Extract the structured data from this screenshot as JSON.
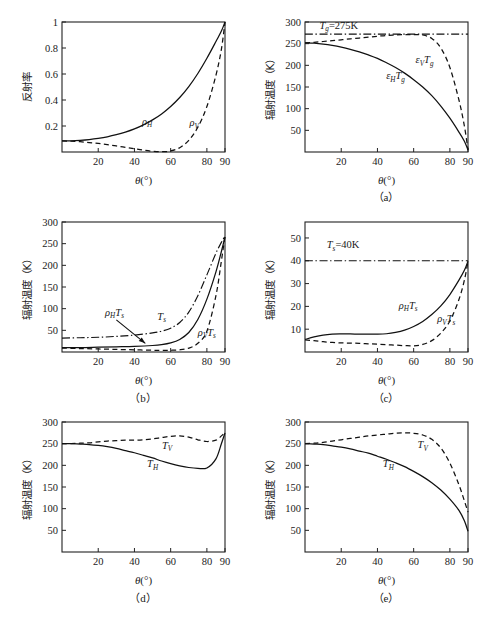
{
  "figure": {
    "width": 490,
    "height": 628,
    "background": "#ffffff",
    "line_color": "#111111"
  },
  "axis_titles": {
    "x_theta": "θ(°)",
    "y_reflectivity": "反射率",
    "y_brightness_temp": "辐射温度（K）"
  },
  "captions": {
    "a": "（a）",
    "b": "（b）",
    "c": "（c）",
    "d": "（d）",
    "e": "（e）"
  },
  "chart_data": [
    {
      "id": "panel0",
      "type": "line",
      "title": "",
      "xlabel": "θ(°)",
      "ylabel": "反射率",
      "xlim": [
        0,
        90
      ],
      "ylim": [
        0,
        1.0
      ],
      "xticks": [
        20,
        40,
        60,
        80,
        90
      ],
      "yticks": [
        0.2,
        0.4,
        0.6,
        0.8,
        1.0
      ],
      "grid": false,
      "legend": "inline-labels",
      "series": [
        {
          "name": "ρ_H",
          "label": "ρ",
          "label_sub": "H",
          "style": "solid",
          "label_pos": {
            "x": 47,
            "y": 0.21
          },
          "x": [
            0,
            5,
            10,
            15,
            20,
            25,
            30,
            35,
            40,
            45,
            50,
            55,
            60,
            65,
            70,
            75,
            80,
            85,
            88,
            90
          ],
          "y": [
            0.085,
            0.086,
            0.09,
            0.096,
            0.105,
            0.117,
            0.133,
            0.153,
            0.178,
            0.209,
            0.247,
            0.293,
            0.35,
            0.419,
            0.503,
            0.604,
            0.721,
            0.85,
            0.93,
            1.0
          ]
        },
        {
          "name": "ρ_V",
          "label": "ρ",
          "label_sub": "V",
          "style": "dashed",
          "label_pos": {
            "x": 73,
            "y": 0.2
          },
          "x": [
            0,
            5,
            10,
            15,
            20,
            25,
            30,
            35,
            40,
            45,
            50,
            55,
            60,
            65,
            70,
            75,
            80,
            85,
            88,
            90
          ],
          "y": [
            0.085,
            0.083,
            0.079,
            0.073,
            0.066,
            0.057,
            0.047,
            0.036,
            0.025,
            0.014,
            0.006,
            0.002,
            0.008,
            0.033,
            0.09,
            0.19,
            0.35,
            0.59,
            0.79,
            1.0
          ]
        }
      ]
    },
    {
      "id": "panel_a",
      "type": "line",
      "title": "",
      "xlabel": "θ(°)",
      "ylabel": "辐射温度（K）",
      "xlim": [
        0,
        90
      ],
      "ylim": [
        0,
        300
      ],
      "xticks": [
        20,
        40,
        60,
        80,
        90
      ],
      "yticks": [
        50,
        100,
        150,
        200,
        250,
        300
      ],
      "grid": false,
      "annotation": {
        "text": "T_g=275K",
        "base": "T",
        "sub": "g",
        "rest": "=275K",
        "x": 8,
        "y": 285
      },
      "series": [
        {
          "name": "T_g",
          "style": "dashdot",
          "constant": 272,
          "x": [
            0,
            90
          ],
          "y": [
            272,
            272
          ]
        },
        {
          "name": "ε_V T_g",
          "label_main": "ε",
          "label_sub1": "V",
          "label_main2": "T",
          "label_sub2": "g",
          "style": "dashed",
          "label_pos": {
            "x": 66,
            "y": 205
          },
          "x": [
            0,
            5,
            10,
            15,
            20,
            25,
            30,
            35,
            40,
            45,
            50,
            55,
            60,
            65,
            70,
            75,
            80,
            85,
            88,
            90
          ],
          "y": [
            252,
            253,
            255,
            257,
            259,
            261,
            263,
            265,
            267,
            269,
            270,
            271,
            271,
            270,
            262,
            240,
            195,
            120,
            60,
            5
          ]
        },
        {
          "name": "ε_H T_g",
          "label_main": "ε",
          "label_sub1": "H",
          "label_main2": "T",
          "label_sub2": "g",
          "style": "solid",
          "label_pos": {
            "x": 50,
            "y": 168
          },
          "x": [
            0,
            5,
            10,
            15,
            20,
            25,
            30,
            35,
            40,
            45,
            50,
            55,
            60,
            65,
            70,
            75,
            80,
            85,
            88,
            90
          ],
          "y": [
            252,
            251,
            249,
            246,
            242,
            237,
            231,
            224,
            216,
            206,
            195,
            182,
            167,
            150,
            130,
            106,
            78,
            46,
            25,
            5
          ]
        }
      ]
    },
    {
      "id": "panel_b",
      "type": "line",
      "title": "",
      "xlabel": "θ(°)",
      "ylabel": "辐射温度（K）",
      "xlim": [
        0,
        90
      ],
      "ylim": [
        0,
        300
      ],
      "xticks": [
        20,
        40,
        60,
        80,
        90
      ],
      "yticks": [
        50,
        100,
        150,
        200,
        250,
        300
      ],
      "grid": false,
      "arrow": {
        "from": {
          "x": 30,
          "y": 74
        },
        "to": {
          "x": 46,
          "y": 20
        }
      },
      "series": [
        {
          "name": "T_s",
          "label_main": "T",
          "label_sub": "s",
          "style": "dashdot",
          "label_pos": {
            "x": 55,
            "y": 75
          },
          "x": [
            0,
            10,
            20,
            30,
            40,
            50,
            55,
            60,
            65,
            70,
            75,
            80,
            85,
            88,
            90
          ],
          "y": [
            32,
            33,
            34,
            36,
            39,
            44,
            48,
            55,
            68,
            92,
            130,
            178,
            228,
            253,
            268
          ]
        },
        {
          "name": "ρ_H T_s",
          "label_main": "ρ",
          "label_sub1": "H",
          "label_main2": "T",
          "label_sub2": "s",
          "style": "solid",
          "label_pos": {
            "x": 29,
            "y": 84
          },
          "x": [
            0,
            10,
            20,
            30,
            40,
            50,
            55,
            60,
            65,
            70,
            75,
            80,
            85,
            88,
            90
          ],
          "y": [
            10,
            10,
            11,
            12,
            13,
            15,
            17,
            21,
            29,
            45,
            75,
            122,
            185,
            232,
            265
          ]
        },
        {
          "name": "ρ_V T_s",
          "label_main": "ρ",
          "label_sub1": "V",
          "label_main2": "T",
          "label_sub2": "s",
          "style": "dashed",
          "label_pos": {
            "x": 80,
            "y": 38
          },
          "x": [
            0,
            10,
            20,
            30,
            40,
            50,
            55,
            60,
            65,
            70,
            75,
            80,
            85,
            88,
            90
          ],
          "y": [
            9,
            8,
            7,
            6,
            5,
            4,
            4,
            4,
            5,
            9,
            20,
            48,
            130,
            210,
            268
          ]
        }
      ]
    },
    {
      "id": "panel_c",
      "type": "line",
      "title": "",
      "xlabel": "θ(°)",
      "ylabel": "辐射温度（K）",
      "xlim": [
        0,
        90
      ],
      "ylim": [
        0,
        57
      ],
      "xticks": [
        20,
        40,
        60,
        80,
        90
      ],
      "yticks": [
        10,
        20,
        30,
        40,
        50
      ],
      "grid": false,
      "annotation": {
        "text": "T_s=40K",
        "base": "T",
        "sub": "s",
        "rest": "=40K",
        "x": 12,
        "y": 45.5
      },
      "series": [
        {
          "name": "T_s",
          "style": "dashdot",
          "constant": 40,
          "x": [
            0,
            90
          ],
          "y": [
            40,
            40
          ]
        },
        {
          "name": "ρ_H T_s",
          "label_main": "ρ",
          "label_sub1": "H",
          "label_main2": "T",
          "label_sub2": "s",
          "style": "solid",
          "label_pos": {
            "x": 57,
            "y": 19
          },
          "x": [
            0,
            5,
            10,
            15,
            20,
            25,
            30,
            35,
            40,
            45,
            50,
            55,
            60,
            65,
            70,
            75,
            80,
            85,
            88,
            90
          ],
          "y": [
            5.5,
            6.6,
            7.4,
            7.8,
            7.9,
            7.9,
            7.8,
            7.8,
            7.8,
            8.0,
            8.6,
            9.6,
            11.2,
            13.4,
            16.4,
            20.2,
            25.2,
            31.5,
            35.8,
            39.8
          ]
        },
        {
          "name": "ρ_V T_s",
          "label_main": "ρ",
          "label_sub1": "V",
          "label_main2": "T",
          "label_sub2": "s",
          "style": "dashed",
          "label_pos": {
            "x": 78,
            "y": 13
          },
          "x": [
            0,
            5,
            10,
            15,
            20,
            25,
            30,
            35,
            40,
            45,
            50,
            55,
            60,
            65,
            70,
            75,
            80,
            85,
            88,
            90
          ],
          "y": [
            5.3,
            5.0,
            4.5,
            4.2,
            4.0,
            3.9,
            3.8,
            3.6,
            3.4,
            3.2,
            3.0,
            2.8,
            2.7,
            3.3,
            5.0,
            8.3,
            13.6,
            23.0,
            31.5,
            39.8
          ]
        }
      ]
    },
    {
      "id": "panel_d",
      "type": "line",
      "title": "",
      "xlabel": "θ(°)",
      "ylabel": "辐射温度（K）",
      "xlim": [
        0,
        90
      ],
      "ylim": [
        0,
        300
      ],
      "xticks": [
        20,
        40,
        60,
        80,
        90
      ],
      "yticks": [
        50,
        100,
        150,
        200,
        250,
        300
      ],
      "grid": false,
      "series": [
        {
          "name": "T_V",
          "label_main": "T",
          "label_sub": "V",
          "style": "dashed",
          "label_pos": {
            "x": 58,
            "y": 238
          },
          "x": [
            0,
            5,
            10,
            15,
            20,
            25,
            30,
            35,
            40,
            45,
            50,
            55,
            60,
            65,
            70,
            75,
            80,
            85,
            88,
            90
          ],
          "y": [
            250,
            250,
            251,
            252,
            254,
            256,
            257,
            258,
            258,
            259,
            261,
            264,
            267,
            268,
            265,
            259,
            255,
            258,
            268,
            276
          ]
        },
        {
          "name": "T_H",
          "label_main": "T",
          "label_sub": "H",
          "style": "solid",
          "label_pos": {
            "x": 50,
            "y": 196
          },
          "x": [
            0,
            5,
            10,
            15,
            20,
            25,
            30,
            35,
            40,
            45,
            50,
            55,
            60,
            65,
            70,
            75,
            80,
            85,
            88,
            90
          ],
          "y": [
            250,
            250,
            249,
            248,
            246,
            243,
            239,
            234,
            229,
            223,
            217,
            210,
            204,
            199,
            195,
            193,
            194,
            215,
            250,
            275
          ]
        }
      ]
    },
    {
      "id": "panel_e",
      "type": "line",
      "title": "",
      "xlabel": "θ(°)",
      "ylabel": "辐射温度（K）",
      "xlim": [
        0,
        90
      ],
      "ylim": [
        0,
        300
      ],
      "xticks": [
        20,
        40,
        60,
        80,
        90
      ],
      "yticks": [
        50,
        100,
        150,
        200,
        250,
        300
      ],
      "grid": false,
      "series": [
        {
          "name": "T_V",
          "label_main": "T",
          "label_sub": "V",
          "style": "dashed",
          "label_pos": {
            "x": 65,
            "y": 240
          },
          "x": [
            0,
            5,
            10,
            15,
            20,
            25,
            30,
            35,
            40,
            45,
            50,
            55,
            60,
            65,
            70,
            75,
            80,
            85,
            88,
            90
          ],
          "y": [
            250,
            251,
            253,
            256,
            259,
            262,
            265,
            268,
            270,
            272,
            274,
            275,
            274,
            270,
            260,
            240,
            205,
            155,
            118,
            92
          ]
        },
        {
          "name": "T_H",
          "label_main": "T",
          "label_sub": "H",
          "style": "solid",
          "label_pos": {
            "x": 46,
            "y": 196
          },
          "x": [
            0,
            5,
            10,
            15,
            20,
            25,
            30,
            35,
            40,
            45,
            50,
            55,
            60,
            65,
            70,
            75,
            80,
            85,
            88,
            90
          ],
          "y": [
            250,
            249,
            248,
            245,
            242,
            238,
            233,
            228,
            221,
            214,
            206,
            197,
            186,
            174,
            160,
            143,
            122,
            96,
            72,
            48
          ]
        }
      ]
    }
  ]
}
